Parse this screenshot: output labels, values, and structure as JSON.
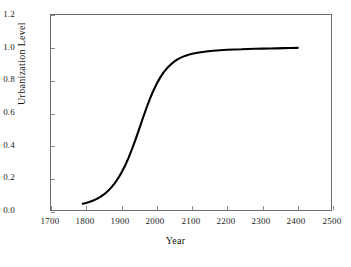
{
  "chart_data": {
    "type": "line",
    "title": "",
    "xlabel": "Year",
    "ylabel": "Urbanization Level",
    "xlim": [
      1700,
      2500
    ],
    "ylim": [
      0.0,
      1.2
    ],
    "xticks": [
      "1700",
      "1800",
      "1900",
      "2000",
      "2100",
      "2200",
      "2300",
      "2400",
      "2500"
    ],
    "yticks": [
      "0.0",
      "0.2",
      "0.4",
      "0.6",
      "0.8",
      "1.0",
      "1.2"
    ],
    "grid": false,
    "legend": "none",
    "line_color": "#000000",
    "series": [
      {
        "name": "Urbanization Level",
        "x": [
          1790,
          1800,
          1810,
          1820,
          1830,
          1840,
          1850,
          1860,
          1870,
          1880,
          1890,
          1900,
          1910,
          1920,
          1930,
          1940,
          1950,
          1960,
          1970,
          1980,
          1990,
          2000,
          2010,
          2020,
          2030,
          2040,
          2050,
          2060,
          2070,
          2080,
          2090,
          2100,
          2120,
          2140,
          2160,
          2180,
          2200,
          2220,
          2240,
          2260,
          2280,
          2300,
          2320,
          2340,
          2360,
          2380,
          2400
        ],
        "values": [
          0.05,
          0.055,
          0.062,
          0.07,
          0.08,
          0.092,
          0.107,
          0.125,
          0.147,
          0.173,
          0.204,
          0.24,
          0.282,
          0.33,
          0.384,
          0.443,
          0.505,
          0.568,
          0.629,
          0.686,
          0.737,
          0.782,
          0.82,
          0.852,
          0.878,
          0.899,
          0.917,
          0.931,
          0.942,
          0.951,
          0.958,
          0.964,
          0.972,
          0.978,
          0.982,
          0.985,
          0.988,
          0.99,
          0.991,
          0.993,
          0.994,
          0.995,
          0.996,
          0.997,
          0.998,
          0.999,
          1.0
        ]
      }
    ]
  },
  "axes": {
    "y_title": "Urbanization Level",
    "x_title": "Year",
    "y_tick_labels": [
      "1.2",
      "1.0",
      "0.8",
      "0.6",
      "0.4",
      "0.2",
      "0.0"
    ],
    "x_tick_labels": [
      "1700",
      "1800",
      "1900",
      "2000",
      "2100",
      "2200",
      "2300",
      "2400",
      "2500"
    ]
  },
  "caption": {
    "text": ""
  }
}
